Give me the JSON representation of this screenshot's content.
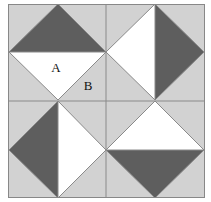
{
  "figure": {
    "frame": {
      "x": 8,
      "y": 4,
      "width": 197,
      "height": 194,
      "border_color": "#888888",
      "background_color": "#d2d2d2"
    },
    "center": {
      "x": 106,
      "y": 101
    },
    "colors": {
      "light_gray": "#d2d2d2",
      "dark_gray": "#5e5e5e",
      "white": "#ffffff",
      "outline": "#8a8a8a",
      "grid_line": "#8a8a8a",
      "label": "#111111",
      "page_background": "#ffffff"
    },
    "grid": {
      "vertical_line_x": 106,
      "horizontal_line_y": 101,
      "rows": 2,
      "columns": 2
    },
    "quadrants": [
      {
        "name": "top-left",
        "cell": {
          "x": 8,
          "y": 4,
          "width": 98,
          "height": 97
        },
        "diamond_vertices": "58,4 106,52 58,100 9,52",
        "dark_half": "58,4 106,52 9,52",
        "white_half": "9,52 106,52 58,100",
        "dark_position": "top",
        "white_position": "bottom"
      },
      {
        "name": "top-right",
        "cell": {
          "x": 106,
          "y": 4,
          "width": 99,
          "height": 97
        },
        "diamond_vertices": "155,4 204,52 155,100 106,52",
        "dark_half": "155,4 204,52 155,100",
        "white_half": "155,4 155,100 106,52",
        "dark_position": "right",
        "white_position": "left"
      },
      {
        "name": "bottom-left",
        "cell": {
          "x": 8,
          "y": 101,
          "width": 98,
          "height": 97
        },
        "diamond_vertices": "58,101 106,150 58,198 9,150",
        "dark_half": "58,101 58,198 9,150",
        "white_half": "58,101 106,150 58,198",
        "dark_position": "left",
        "white_position": "right"
      },
      {
        "name": "bottom-right",
        "cell": {
          "x": 106,
          "y": 101,
          "width": 99,
          "height": 97
        },
        "diamond_vertices": "155,101 204,150 155,198 106,150",
        "dark_half": "106,150 204,150 155,198",
        "white_half": "155,101 204,150 106,150",
        "dark_position": "bottom",
        "white_position": "top"
      }
    ],
    "labels": [
      {
        "text": "A",
        "x": 56,
        "y": 69,
        "region": "white-triangle-top-left"
      },
      {
        "text": "B",
        "x": 88,
        "y": 87,
        "region": "light-gray-corner-top-left"
      }
    ]
  }
}
